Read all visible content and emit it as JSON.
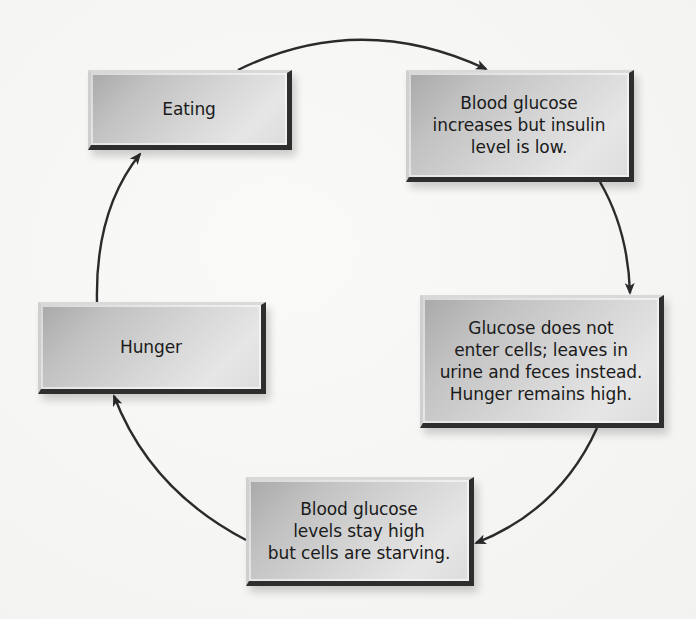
{
  "diagram": {
    "type": "cycle",
    "nodes": [
      {
        "id": "eating",
        "label": "Eating"
      },
      {
        "id": "glucose-increases",
        "label": "Blood glucose\nincreases but insulin\nlevel is low."
      },
      {
        "id": "glucose-not-enter",
        "label": "Glucose does not\nenter cells; leaves in\nurine and feces instead.\nHunger remains high."
      },
      {
        "id": "cells-starving",
        "label": "Blood glucose\nlevels stay high\nbut cells are starving."
      },
      {
        "id": "hunger",
        "label": "Hunger"
      }
    ],
    "edges": [
      {
        "from": "eating",
        "to": "glucose-increases"
      },
      {
        "from": "glucose-increases",
        "to": "glucose-not-enter"
      },
      {
        "from": "glucose-not-enter",
        "to": "cells-starving"
      },
      {
        "from": "cells-starving",
        "to": "hunger"
      },
      {
        "from": "hunger",
        "to": "eating"
      }
    ],
    "colors": {
      "arrow": "#2b2b2b",
      "box_fill": "#c8c8c8",
      "box_edge": "#2e2e2e",
      "text": "#1a1a1a"
    }
  }
}
